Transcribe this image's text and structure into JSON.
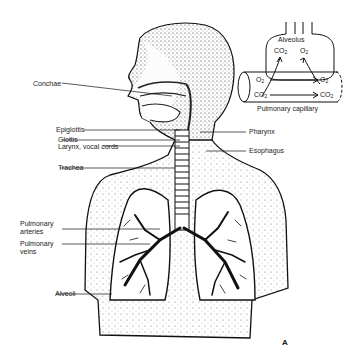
{
  "figure": {
    "letter": "A",
    "left_labels": {
      "conchae": "Conchae",
      "epiglottis": "Epiglottis",
      "glottis": "Glottis",
      "larynx": "Larynx, vocal cords",
      "trachea": "Trachea",
      "pulm_arteries_1": "Pulmonary",
      "pulm_arteries_2": "arteries",
      "pulm_veins_1": "Pulmonary",
      "pulm_veins_2": "veins",
      "alveoli": "Alveoli"
    },
    "right_labels": {
      "pharynx": "Pharynx",
      "esophagus": "Esophagus"
    },
    "inset": {
      "alveolus": "Alveolus",
      "co2_top": "CO",
      "o2_top": "O",
      "o2_left": "O",
      "co2_left": "CO",
      "o2_right": "O",
      "co2_right": "CO",
      "sub2": "2",
      "capillary": "Pulmonary capillary"
    }
  }
}
